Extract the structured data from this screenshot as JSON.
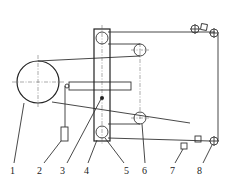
{
  "diagram": {
    "type": "mechanical schematic",
    "callouts": [
      {
        "id": "1",
        "label": "1"
      },
      {
        "id": "2",
        "label": "2"
      },
      {
        "id": "3",
        "label": "3"
      },
      {
        "id": "4",
        "label": "4"
      },
      {
        "id": "5",
        "label": "5"
      },
      {
        "id": "6",
        "label": "6"
      },
      {
        "id": "7",
        "label": "7"
      },
      {
        "id": "8",
        "label": "8"
      }
    ],
    "colors": {
      "line": "#333333",
      "background": "#ffffff"
    }
  }
}
